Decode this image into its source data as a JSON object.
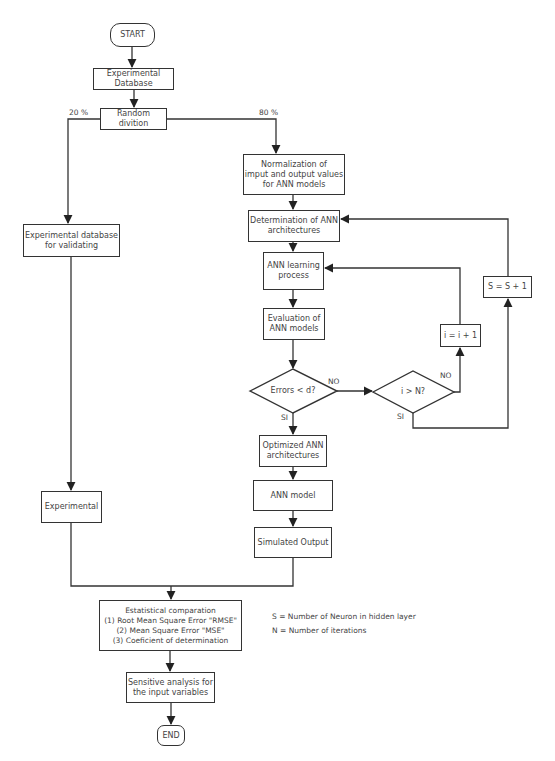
{
  "diagram": {
    "nodes": {
      "start": "START",
      "exp_database": "Experimental\nDatabase",
      "random_division": "Random divition",
      "normalization": "Normalization of\nimput and output values\nfor ANN models",
      "determination": "Determination of ANN\narchitectures",
      "learning": "ANN learning\nprocess",
      "evaluation": "Evaluation of\nANN models",
      "errors_decision": "Errors < d?",
      "iter_decision": "i > N?",
      "i_increment": "i = i + 1",
      "s_increment": "S = S + 1",
      "optimized": "Optimized ANN\narchitectures",
      "ann_model": "ANN model",
      "simulated_output": "Simulated Output",
      "validation_db": "Experimental database\nfor validating",
      "experimental": "Experimental",
      "statistical": "Estatistical comparation\n(1) Root Mean Square Error \"RMSE\"\n(2) Mean Square Error \"MSE\"\n(3) Coeficient of determination",
      "sensitive": "Sensitive analysis for\nthe input variables",
      "end": "END"
    },
    "edge_labels": {
      "split_left": "20 %",
      "split_right": "80 %",
      "errors_no": "NO",
      "errors_yes": "SI",
      "iter_no": "NO",
      "iter_yes": "SI"
    },
    "legend": [
      "S = Number of Neuron in hidden layer",
      "N = Number of iterations"
    ]
  }
}
